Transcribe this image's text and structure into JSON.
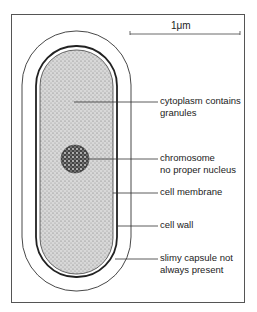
{
  "diagram": {
    "scale_bar": {
      "label": "1μm"
    },
    "labels": [
      {
        "id": "cytoplasm",
        "line1": "cytoplasm contains",
        "line2": "granules"
      },
      {
        "id": "chromosome",
        "line1": "chromosome",
        "line2": "no proper nucleus"
      },
      {
        "id": "membrane",
        "line1": "cell membrane",
        "line2": ""
      },
      {
        "id": "wall",
        "line1": "cell wall",
        "line2": ""
      },
      {
        "id": "capsule",
        "line1": "slimy capsule not",
        "line2": "always present"
      }
    ],
    "colors": {
      "line": "#333333",
      "cytoplasm_fill": "#c9c9c9",
      "chromosome_fill": "#3a3a3a",
      "frame": "#555555"
    }
  }
}
